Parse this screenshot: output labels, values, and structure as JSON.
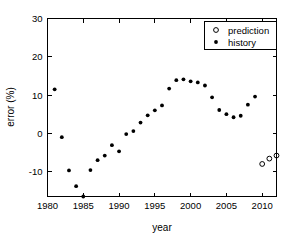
{
  "chart_data": {
    "type": "scatter",
    "title": "",
    "xlabel": "year",
    "ylabel": "error (%)",
    "xlim": [
      1980,
      2012
    ],
    "ylim": [
      -16.5,
      30
    ],
    "xticks": [
      1980,
      1985,
      1990,
      1995,
      2000,
      2005,
      2010
    ],
    "yticks": [
      30,
      20,
      10,
      0,
      -10
    ],
    "xtick_labels": [
      "1980",
      "1985",
      "1990",
      "1995",
      "2000",
      "2005",
      "2010"
    ],
    "ytick_labels": [
      "30",
      "20",
      "10",
      "0",
      "-10"
    ],
    "grid": false,
    "legend_position": "top-right",
    "legend": [
      "prediction",
      "history"
    ],
    "series": [
      {
        "name": "history",
        "marker": "filled-circle",
        "color": "#000000",
        "x": [
          1981,
          1982,
          1983,
          1984,
          1985,
          1986,
          1987,
          1988,
          1989,
          1990,
          1991,
          1992,
          1993,
          1994,
          1995,
          1996,
          1997,
          1998,
          1999,
          2000,
          2001,
          2002,
          2003,
          2004,
          2005,
          2006,
          2007,
          2008,
          2009
        ],
        "y": [
          11.5,
          -1.0,
          -9.7,
          -13.8,
          -16.5,
          -9.6,
          -7.0,
          -5.8,
          -3.1,
          -4.7,
          -0.2,
          0.6,
          2.8,
          4.7,
          6.0,
          7.3,
          11.7,
          13.9,
          14.1,
          13.6,
          13.3,
          12.5,
          9.4,
          6.1,
          5.0,
          4.2,
          4.6,
          7.5,
          9.6
        ]
      },
      {
        "name": "prediction",
        "marker": "open-circle",
        "color": "#000000",
        "x": [
          2010,
          2011,
          2012
        ],
        "y": [
          -8.0,
          -6.6,
          -5.8
        ]
      }
    ]
  },
  "axes": {
    "xlabel": "year",
    "ylabel": "error (%)"
  },
  "legend": {
    "entries": [
      {
        "label": "prediction",
        "marker": "open-circle"
      },
      {
        "label": "history",
        "marker": "filled-circle"
      }
    ]
  }
}
